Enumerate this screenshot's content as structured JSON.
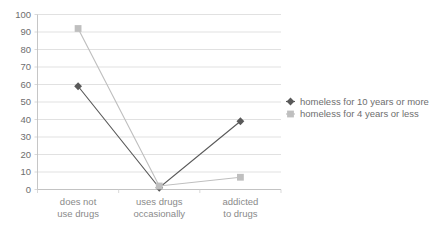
{
  "chart_data": {
    "type": "line",
    "title": "",
    "xlabel": "",
    "ylabel": "",
    "ylim": [
      0,
      100
    ],
    "ytick_step": 10,
    "yticks": [
      "0",
      "10",
      "20",
      "30",
      "40",
      "50",
      "60",
      "70",
      "80",
      "90",
      "100"
    ],
    "grid": true,
    "legend_position": "right",
    "categories": [
      "does not use drugs",
      "uses drugs occasionally",
      "addicted to drugs"
    ],
    "category_lines": [
      [
        "does not",
        "use drugs"
      ],
      [
        "uses drugs",
        "occasionally"
      ],
      [
        "addicted",
        "to drugs"
      ]
    ],
    "series": [
      {
        "name": "homeless for 10 years or more",
        "values": [
          59,
          1,
          39
        ],
        "color": "#595959",
        "marker": "diamond"
      },
      {
        "name": "homeless for 4 years or less",
        "values": [
          92,
          2,
          7
        ],
        "color": "#bfbfbf",
        "marker": "square"
      }
    ]
  },
  "legend": {
    "items": [
      {
        "label": "homeless for 10 years or more",
        "color": "#595959",
        "marker": "diamond-marker-icon"
      },
      {
        "label": "homeless for 4 years or less",
        "color": "#bfbfbf",
        "marker": "square-marker-icon"
      }
    ]
  },
  "colors": {
    "series_dark": "#595959",
    "series_light": "#bfbfbf",
    "gridline": "#d9d9d9",
    "axis": "#bfbfbf",
    "tick_text": "#6e6e6e",
    "category_text": "#8a8a8a",
    "background": "#ffffff"
  }
}
